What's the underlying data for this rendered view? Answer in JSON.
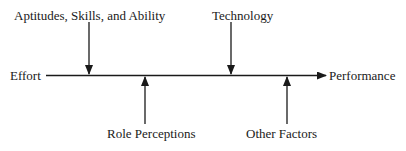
{
  "diagram": {
    "input_label": "Effort",
    "output_label": "Performance",
    "top_factors": [
      {
        "label": "Aptitudes, Skills, and Ability"
      },
      {
        "label": "Technology"
      }
    ],
    "bottom_factors": [
      {
        "label": "Role Perceptions"
      },
      {
        "label": "Other Factors"
      }
    ],
    "colors": {
      "line": "#1a1a1a",
      "background": "#ffffff"
    }
  }
}
